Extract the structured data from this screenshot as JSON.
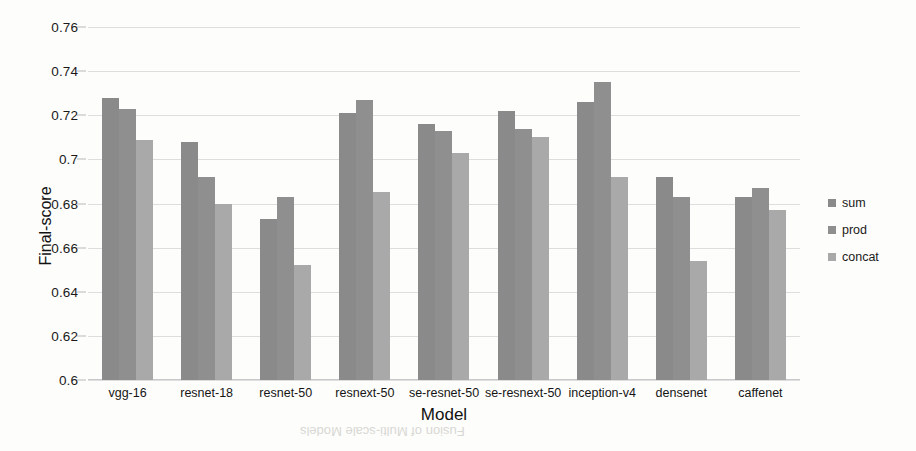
{
  "chart_data": {
    "type": "bar",
    "title": "",
    "xlabel": "Model",
    "ylabel": "Final-score",
    "ylim": [
      0.6,
      0.76
    ],
    "ytick_step": 0.02,
    "yticks": [
      "0.6",
      "0.62",
      "0.64",
      "0.66",
      "0.68",
      "0.7",
      "0.72",
      "0.74",
      "0.76"
    ],
    "grid": true,
    "legend_position": "right",
    "categories": [
      "vgg-16",
      "resnet-18",
      "resnet-50",
      "resnext-50",
      "se-resnet-50",
      "se-resnext-50",
      "inception-v4",
      "densenet",
      "caffenet"
    ],
    "series": [
      {
        "name": "sum",
        "color": "#8a8a8a",
        "values": [
          0.728,
          0.708,
          0.673,
          0.721,
          0.716,
          0.722,
          0.726,
          0.692,
          0.683
        ]
      },
      {
        "name": "prod",
        "color": "#8f8f8f",
        "values": [
          0.723,
          0.692,
          0.683,
          0.727,
          0.713,
          0.714,
          0.735,
          0.683,
          0.687
        ]
      },
      {
        "name": "concat",
        "color": "#a9a9a9",
        "values": [
          0.709,
          0.68,
          0.652,
          0.685,
          0.703,
          0.71,
          0.692,
          0.654,
          0.677
        ]
      }
    ]
  },
  "legend": {
    "items": [
      {
        "label": "sum",
        "color": "#8a8a8a"
      },
      {
        "label": "prod",
        "color": "#8f8f8f"
      },
      {
        "label": "concat",
        "color": "#a9a9a9"
      }
    ]
  },
  "artifacts": {
    "bleed_caption": "Fusion of Multi-scale Models"
  }
}
